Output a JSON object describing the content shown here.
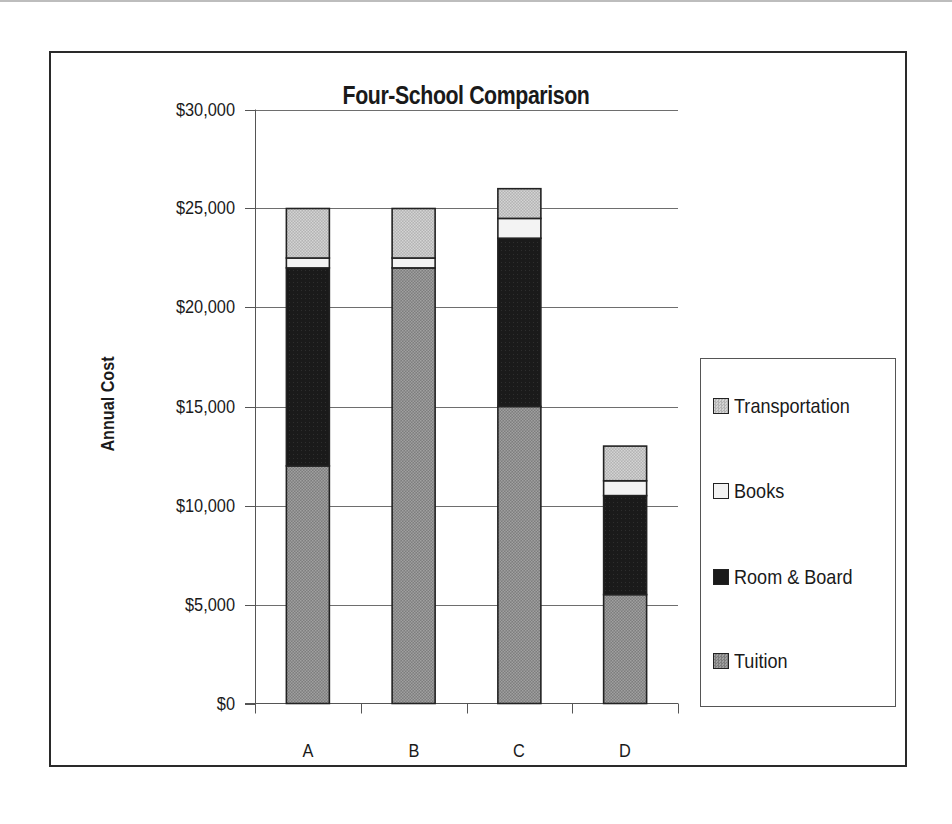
{
  "chart_data": {
    "type": "bar",
    "stacked": true,
    "title": "Four-School Comparison",
    "xlabel": "",
    "ylabel": "Annual Cost",
    "categories": [
      "A",
      "B",
      "C",
      "D"
    ],
    "series": [
      {
        "name": "Tuition",
        "values": [
          12000,
          22000,
          15000,
          5500
        ],
        "color": "#8a8a8a",
        "pattern": "checker-dark"
      },
      {
        "name": "Room & Board",
        "values": [
          10000,
          0,
          8500,
          5000
        ],
        "color": "#1c1c1c",
        "pattern": "solid-black"
      },
      {
        "name": "Books",
        "values": [
          500,
          500,
          1000,
          750
        ],
        "color": "#f2f2f2",
        "pattern": "white"
      },
      {
        "name": "Transportation",
        "values": [
          2500,
          2500,
          1500,
          1750
        ],
        "color": "#bdbdbd",
        "pattern": "checker-light"
      }
    ],
    "totals": [
      25000,
      25000,
      26000,
      13000
    ],
    "ylim": [
      0,
      30000
    ],
    "yticks": [
      0,
      5000,
      10000,
      15000,
      20000,
      25000,
      30000
    ],
    "ytick_labels": [
      "$0",
      "$5,000",
      "$10,000",
      "$15,000",
      "$20,000",
      "$25,000",
      "$30,000"
    ],
    "grid": {
      "horizontal": true,
      "vertical": false
    },
    "legend": {
      "position": "right",
      "order": [
        "Transportation",
        "Books",
        "Room & Board",
        "Tuition"
      ]
    }
  },
  "legend_labels": [
    "Transportation",
    "Books",
    "Room & Board",
    "Tuition"
  ]
}
